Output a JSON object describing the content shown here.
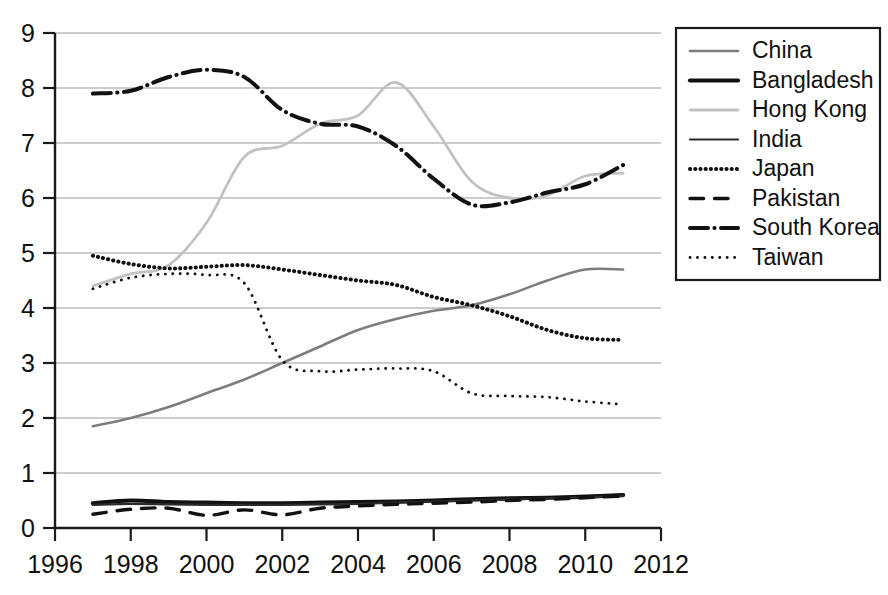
{
  "chart_data": {
    "type": "line",
    "title": "",
    "subtitle": "",
    "xlabel": "",
    "ylabel": "",
    "xlim": [
      1996,
      2012
    ],
    "ylim": [
      0,
      9
    ],
    "grid": true,
    "legend_position": "right",
    "x_ticks": [
      "1996",
      "1998",
      "2000",
      "2002",
      "2004",
      "2006",
      "2008",
      "2010",
      "2012"
    ],
    "y_ticks": [
      "0",
      "1",
      "2",
      "3",
      "4",
      "5",
      "6",
      "7",
      "8",
      "9"
    ],
    "x": [
      1997,
      1998,
      1999,
      2000,
      2001,
      2002,
      2003,
      2004,
      2005,
      2006,
      2007,
      2008,
      2009,
      2010,
      2011
    ],
    "series": [
      {
        "name": "China",
        "style": "solid",
        "color": "#7d7d7d",
        "width": 2.6,
        "values": [
          1.85,
          2.0,
          2.2,
          2.45,
          2.7,
          3.0,
          3.3,
          3.6,
          3.8,
          3.95,
          4.05,
          4.25,
          4.5,
          4.7,
          4.7
        ]
      },
      {
        "name": "Bangladesh",
        "style": "solid",
        "color": "#111111",
        "width": 4.2,
        "values": [
          0.45,
          0.5,
          0.47,
          0.46,
          0.45,
          0.45,
          0.46,
          0.47,
          0.48,
          0.5,
          0.52,
          0.54,
          0.55,
          0.57,
          0.6
        ]
      },
      {
        "name": "Hong Kong",
        "style": "solid",
        "color": "#c2c2c2",
        "width": 2.8,
        "values": [
          4.4,
          4.62,
          4.78,
          5.55,
          6.75,
          6.95,
          7.35,
          7.5,
          8.1,
          7.3,
          6.3,
          6.0,
          6.05,
          6.4,
          6.45
        ]
      },
      {
        "name": "India",
        "style": "solid",
        "color": "#2b2b2b",
        "width": 2.2,
        "values": [
          0.42,
          0.44,
          0.43,
          0.42,
          0.42,
          0.42,
          0.43,
          0.44,
          0.46,
          0.48,
          0.5,
          0.52,
          0.54,
          0.56,
          0.58
        ]
      },
      {
        "name": "Japan",
        "style": "dotted-thick",
        "color": "#111111",
        "width": 4.0,
        "values": [
          4.95,
          4.8,
          4.72,
          4.75,
          4.78,
          4.7,
          4.6,
          4.5,
          4.42,
          4.2,
          4.05,
          3.85,
          3.6,
          3.45,
          3.42
        ]
      },
      {
        "name": "Pakistan",
        "style": "dashed",
        "color": "#111111",
        "width": 3.4,
        "values": [
          0.25,
          0.34,
          0.36,
          0.23,
          0.33,
          0.24,
          0.36,
          0.4,
          0.43,
          0.45,
          0.47,
          0.5,
          0.52,
          0.55,
          0.58
        ]
      },
      {
        "name": "South Korea",
        "style": "dash-dot",
        "color": "#111111",
        "width": 4.0,
        "values": [
          7.9,
          7.95,
          8.2,
          8.33,
          8.2,
          7.6,
          7.35,
          7.3,
          6.95,
          6.35,
          5.88,
          5.92,
          6.1,
          6.25,
          6.6
        ]
      },
      {
        "name": "Taiwan",
        "style": "dotted-fine",
        "color": "#111111",
        "width": 2.8,
        "values": [
          4.35,
          4.55,
          4.62,
          4.6,
          4.45,
          3.05,
          2.85,
          2.88,
          2.9,
          2.85,
          2.45,
          2.4,
          2.38,
          2.3,
          2.25
        ]
      }
    ]
  },
  "legend": {
    "items": [
      {
        "label": "China"
      },
      {
        "label": "Bangladesh"
      },
      {
        "label": "Hong Kong"
      },
      {
        "label": "India"
      },
      {
        "label": "Japan"
      },
      {
        "label": "Pakistan"
      },
      {
        "label": "South Korea"
      },
      {
        "label": "Taiwan"
      }
    ]
  }
}
